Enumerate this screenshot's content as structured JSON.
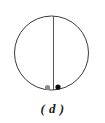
{
  "figure": {
    "caption": "( d )",
    "background_color": "#ffffff",
    "stroke_color": "#3a3a3a",
    "caption_color": "#1a1a1a",
    "circle": {
      "center_x": 51.5,
      "center_y": 53,
      "radius": 37,
      "stroke_width": 1
    },
    "diameter_line": {
      "x": 53.5,
      "y_top": 16,
      "y_bottom": 95,
      "stroke_width": 1,
      "color": "#555555"
    },
    "points": [
      {
        "name": "gray-dot",
        "cx": 47.5,
        "cy": 87.5,
        "r": 2.6,
        "color": "#8a8a8a",
        "side": "left-of-line"
      },
      {
        "name": "black-dot",
        "cx": 58,
        "cy": 87,
        "r": 2.6,
        "color": "#0d0d0d",
        "side": "right-of-line"
      }
    ]
  },
  "chart_data": {
    "type": "scatter",
    "title": "( d )",
    "xlabel": "",
    "ylabel": "",
    "xlim": [
      -1,
      1
    ],
    "ylim": [
      -1,
      1
    ],
    "grid": false,
    "legend": "none",
    "annotations": [
      "circle outline of radius 37 px centered at (51.5, 53)",
      "vertical diameter line at x = 53.5 from top to bottom of circle",
      "two marker points near the bottom interior of the circle"
    ],
    "series": [
      {
        "name": "gray-point",
        "color": "#8a8a8a",
        "x": [
          -0.16
        ],
        "y": [
          -0.93
        ]
      },
      {
        "name": "black-point",
        "color": "#0d0d0d",
        "x": [
          0.12
        ],
        "y": [
          -0.92
        ]
      }
    ]
  }
}
